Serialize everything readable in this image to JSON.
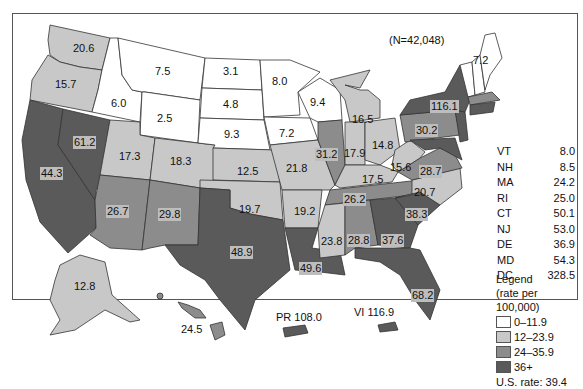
{
  "title": "(N=42,048)",
  "colors": {
    "bin_0": "#ffffff",
    "bin_1": "#c8c8c8",
    "bin_2": "#8c8c8c",
    "bin_3": "#5a5a5a",
    "border": "#333333"
  },
  "states": [
    {
      "abbr": "WA",
      "value": "20.6"
    },
    {
      "abbr": "OR",
      "value": "15.7"
    },
    {
      "abbr": "CA",
      "value": "44.3"
    },
    {
      "abbr": "NV",
      "value": "61.2"
    },
    {
      "abbr": "ID",
      "value": "6.0"
    },
    {
      "abbr": "MT",
      "value": "7.5"
    },
    {
      "abbr": "WY",
      "value": "2.5"
    },
    {
      "abbr": "UT",
      "value": "17.3"
    },
    {
      "abbr": "AZ",
      "value": "26.7"
    },
    {
      "abbr": "CO",
      "value": "18.3"
    },
    {
      "abbr": "NM",
      "value": "29.8"
    },
    {
      "abbr": "ND",
      "value": "3.1"
    },
    {
      "abbr": "SD",
      "value": "4.8"
    },
    {
      "abbr": "NE",
      "value": "9.3"
    },
    {
      "abbr": "KS",
      "value": "12.5"
    },
    {
      "abbr": "OK",
      "value": "19.7"
    },
    {
      "abbr": "TX",
      "value": "48.9"
    },
    {
      "abbr": "MN",
      "value": "8.0"
    },
    {
      "abbr": "IA",
      "value": "7.2"
    },
    {
      "abbr": "MO",
      "value": "21.8"
    },
    {
      "abbr": "AR",
      "value": "19.2"
    },
    {
      "abbr": "LA",
      "value": "49.6"
    },
    {
      "abbr": "WI",
      "value": "9.4"
    },
    {
      "abbr": "IL",
      "value": "31.2"
    },
    {
      "abbr": "MI",
      "value": "16.5"
    },
    {
      "abbr": "IN",
      "value": "17.9"
    },
    {
      "abbr": "OH",
      "value": "14.8"
    },
    {
      "abbr": "KY",
      "value": "17.5"
    },
    {
      "abbr": "TN",
      "value": "26.2"
    },
    {
      "abbr": "MS",
      "value": "23.8"
    },
    {
      "abbr": "AL",
      "value": "28.8"
    },
    {
      "abbr": "GA",
      "value": "37.6"
    },
    {
      "abbr": "FL",
      "value": "68.2"
    },
    {
      "abbr": "SC",
      "value": "38.3"
    },
    {
      "abbr": "NC",
      "value": "20.7"
    },
    {
      "abbr": "VA",
      "value": "28.7"
    },
    {
      "abbr": "WV",
      "value": "15.6"
    },
    {
      "abbr": "PA",
      "value": "30.2"
    },
    {
      "abbr": "NY",
      "value": "116.1"
    },
    {
      "abbr": "ME",
      "value": "7.2"
    },
    {
      "abbr": "AK",
      "value": "12.8"
    },
    {
      "abbr": "HI",
      "value": "24.5"
    }
  ],
  "territories": {
    "pr": "PR 108.0",
    "vi": "VI 116.9"
  },
  "small_states": [
    {
      "abbr": "VT",
      "value": "8.0"
    },
    {
      "abbr": "NH",
      "value": "8.5"
    },
    {
      "abbr": "MA",
      "value": "24.2"
    },
    {
      "abbr": "RI",
      "value": "25.0"
    },
    {
      "abbr": "CT",
      "value": "50.1"
    },
    {
      "abbr": "NJ",
      "value": "53.0"
    },
    {
      "abbr": "DE",
      "value": "36.9"
    },
    {
      "abbr": "MD",
      "value": "54.3"
    },
    {
      "abbr": "DC",
      "value": "328.5"
    }
  ],
  "legend": {
    "title": "Legend",
    "subtitle": "(rate per 100,000)",
    "bins": [
      "0–11.9",
      "12–23.9",
      "24–35.9",
      "36+"
    ],
    "us_rate": "U.S. rate: 39.4"
  }
}
